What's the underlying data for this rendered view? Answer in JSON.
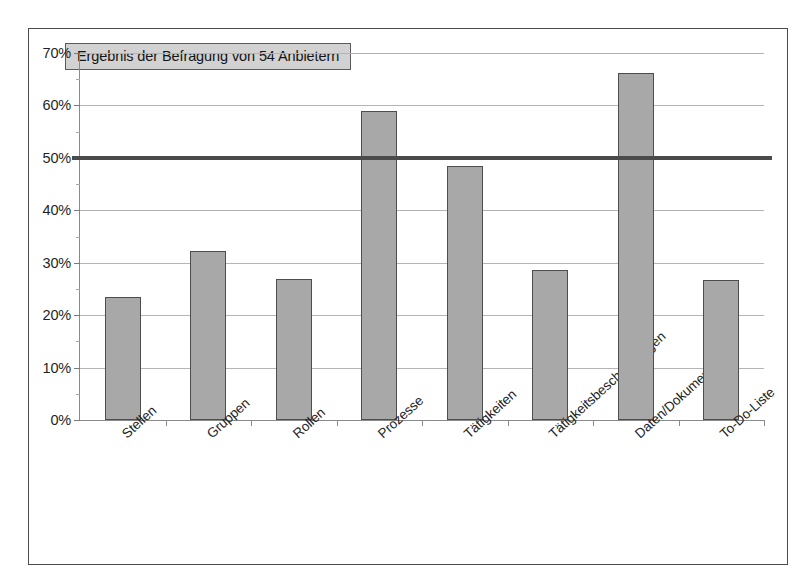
{
  "chart_data": {
    "type": "bar",
    "title": "",
    "subtitle": "",
    "xlabel": "",
    "ylabel": "",
    "ylim": [
      0,
      70
    ],
    "ytick_values": [
      0,
      10,
      20,
      30,
      40,
      50,
      60,
      70
    ],
    "ytick_labels": [
      "0%",
      "10%",
      "20%",
      "30%",
      "40%",
      "50%",
      "60%",
      "70%"
    ],
    "grid": true,
    "legend": "none",
    "unit": "%",
    "categories": [
      "Stellen",
      "Gruppen",
      "Rollen",
      "Prozesse",
      "Tätigkeiten",
      "Tätigkeitsbeschreibungen",
      "Daten/Dokumente",
      "To-Do-Liste"
    ],
    "values": [
      23.4,
      32.2,
      26.9,
      59.0,
      48.5,
      28.7,
      66.2,
      26.7
    ],
    "annotations": [
      {
        "name": "survey-note",
        "text": "Ergebnis der Befragung von 54 Anbietern"
      }
    ],
    "reference_line": {
      "value": 50,
      "label": "50%",
      "color": "#4b4b4b"
    },
    "colors": {
      "bar_fill": "#a8a8a8",
      "bar_border": "#4d4d4d",
      "gridline": "#b4b4b4",
      "axis": "#8a8a8a",
      "frame": "#4a4a4a",
      "annotation_fill": "#d2d2d2",
      "text": "#1f1f1f"
    }
  }
}
